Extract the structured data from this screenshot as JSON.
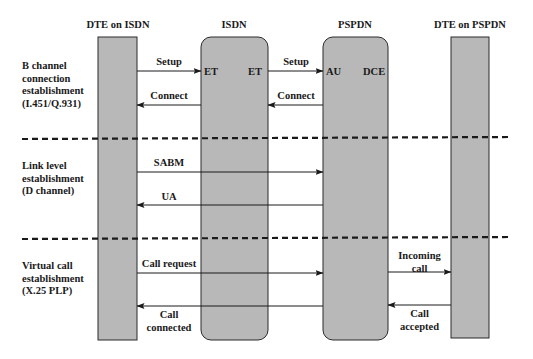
{
  "colors": {
    "box_fill": "#b8b8b8",
    "box_stroke": "#2a2a2a",
    "line": "#1a1a1a",
    "background": "#ffffff"
  },
  "entities": [
    {
      "id": "dte_isdn",
      "label": "DTE on ISDN",
      "shape": "rectangle"
    },
    {
      "id": "isdn",
      "label": "ISDN",
      "shape": "rounded-rectangle",
      "left_port": "ET",
      "right_port": "ET"
    },
    {
      "id": "pspdn",
      "label": "PSPDN",
      "shape": "rounded-rectangle",
      "left_port": "AU",
      "right_port": "DCE"
    },
    {
      "id": "dte_pspdn",
      "label": "DTE on PSPDN",
      "shape": "rectangle"
    }
  ],
  "phases": [
    {
      "lines": [
        "B channel",
        "connection",
        "establishment",
        "(I.451/Q.931)"
      ]
    },
    {
      "lines": [
        "Link level",
        "establishment",
        "(D channel)"
      ]
    },
    {
      "lines": [
        "Virtual call",
        "establishment",
        "(X.25 PLP)"
      ]
    }
  ],
  "messages": [
    {
      "label": [
        "Setup"
      ],
      "from": "DTE on ISDN",
      "to": "ISDN",
      "direction": "right"
    },
    {
      "label": [
        "Setup"
      ],
      "from": "ISDN",
      "to": "PSPDN",
      "direction": "right"
    },
    {
      "label": [
        "Connect"
      ],
      "from": "ISDN",
      "to": "DTE on ISDN",
      "direction": "left"
    },
    {
      "label": [
        "Connect"
      ],
      "from": "PSPDN",
      "to": "ISDN",
      "direction": "left"
    },
    {
      "label": [
        "SABM"
      ],
      "from": "DTE on ISDN",
      "to": "PSPDN",
      "direction": "right"
    },
    {
      "label": [
        "UA"
      ],
      "from": "PSPDN",
      "to": "DTE on ISDN",
      "direction": "left"
    },
    {
      "label": [
        "Call request"
      ],
      "from": "DTE on ISDN",
      "to": "PSPDN",
      "direction": "right"
    },
    {
      "label": [
        "Call",
        "connected"
      ],
      "from": "PSPDN",
      "to": "DTE on ISDN",
      "direction": "left"
    },
    {
      "label": [
        "Incoming",
        "call"
      ],
      "from": "PSPDN",
      "to": "DTE on PSPDN",
      "direction": "right"
    },
    {
      "label": [
        "Call",
        "accepted"
      ],
      "from": "DTE on PSPDN",
      "to": "PSPDN",
      "direction": "left"
    }
  ]
}
